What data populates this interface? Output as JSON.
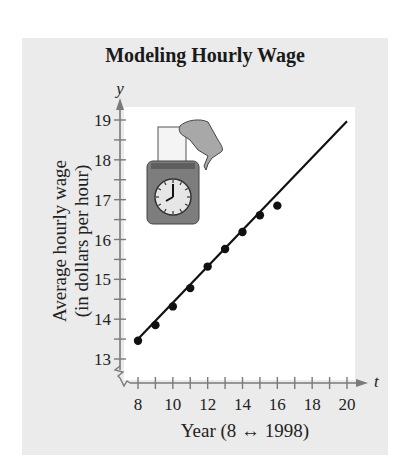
{
  "chart_data": {
    "type": "scatter",
    "title": "Modeling Hourly Wage",
    "xlabel": "Year (8 ↔ 1998)",
    "ylabel": "Average hourly wage (in dollars per hour)",
    "ylabel_lines": [
      "Average hourly wage",
      "(in dollars per hour)"
    ],
    "x_axis_var": "t",
    "y_axis_var": "y",
    "xlim": [
      8,
      20
    ],
    "ylim": [
      13,
      19
    ],
    "x_ticks": [
      8,
      9,
      10,
      11,
      12,
      13,
      14,
      15,
      16,
      17,
      18,
      19,
      20
    ],
    "x_tick_labels": [
      "8",
      "10",
      "12",
      "14",
      "16",
      "18",
      "20"
    ],
    "y_ticks": [
      13,
      13.5,
      14,
      14.5,
      15,
      15.5,
      16,
      16.5,
      17,
      17.5,
      18,
      18.5,
      19
    ],
    "y_tick_labels": [
      "13",
      "14",
      "15",
      "16",
      "17",
      "18",
      "19"
    ],
    "grid": false,
    "axis_break": "y-axis zigzag below 13",
    "series": [
      {
        "name": "Observed wage",
        "kind": "scatter",
        "x": [
          8,
          9,
          10,
          11,
          12,
          13,
          14,
          15,
          16
        ],
        "y": [
          13.46,
          13.85,
          14.32,
          14.78,
          15.32,
          15.76,
          16.19,
          16.61,
          16.85
        ]
      },
      {
        "name": "Linear model",
        "kind": "line",
        "x": [
          8,
          20
        ],
        "y": [
          13.5,
          18.97
        ]
      }
    ],
    "annotations": [
      "Illustration: hand inserting a time card into a punch clock"
    ]
  },
  "colors": {
    "panel": "#ebebeb",
    "plot": "#ffffff",
    "axis": "#7a7a7a",
    "data": "#111111",
    "clock_body": "#7d7d7d",
    "clock_face": "#e6e6e6"
  },
  "labels": {
    "title": "Modeling Hourly Wage",
    "y_var": "y",
    "t_var": "t",
    "ylabel_line1": "Average hourly wage",
    "ylabel_line2": "(in dollars per hour)",
    "xlabel": "Year (8 ↔ 1998)"
  }
}
